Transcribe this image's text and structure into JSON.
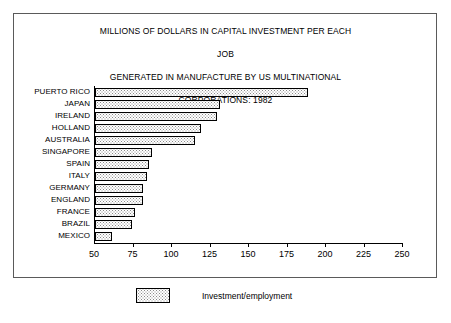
{
  "chart_data": {
    "type": "bar",
    "orientation": "horizontal",
    "title": "MILLIONS OF DOLLARS IN CAPITAL INVESTMENT PER EACH JOB\nGENERATED IN MANUFACTURE BY US MULTINATIONAL\nCORPORATIONS: 1982",
    "title_lines": [
      "MILLIONS OF DOLLARS IN CAPITAL INVESTMENT PER EACH",
      "JOB",
      "GENERATED IN MANUFACTURE BY US MULTINATIONAL",
      "CORPORATIONS: 1982"
    ],
    "categories": [
      "PUERTO RICO",
      "JAPAN",
      "IRELAND",
      "HOLLAND",
      "AUSTRALIA",
      "SINGAPORE",
      "SPAIN",
      "ITALY",
      "GERMANY",
      "ENGLAND",
      "FRANCE",
      "BRAZIL",
      "MEXICO"
    ],
    "values": [
      188,
      131,
      129,
      119,
      115,
      87,
      85,
      84,
      81,
      81,
      76,
      74,
      61
    ],
    "series": [
      {
        "name": "Investment/employment",
        "values": [
          188,
          131,
          129,
          119,
          115,
          87,
          85,
          84,
          81,
          81,
          76,
          74,
          61
        ]
      }
    ],
    "xlabel": "",
    "ylabel": "",
    "xlim": [
      50,
      250
    ],
    "xticks": [
      50,
      75,
      100,
      125,
      150,
      175,
      200,
      225,
      250
    ],
    "xtick_labels": [
      "50",
      "75",
      "100",
      "125",
      "150",
      "175",
      "200",
      "225",
      "250"
    ],
    "grid": false,
    "legend": {
      "position": "bottom",
      "entries": [
        {
          "label": "Investment/employment",
          "pattern": "dotted",
          "border_color": "#000000"
        }
      ]
    },
    "colors": {
      "bar_fill": "#ffffff",
      "bar_pattern": "#8a8a8a",
      "bar_border": "#000000",
      "axis": "#000000",
      "frame": "#5a5a5a",
      "background": "#ffffff",
      "text": "#000000"
    }
  }
}
